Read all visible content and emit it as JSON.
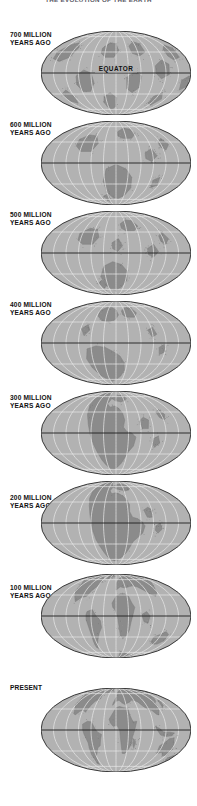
{
  "figure": {
    "title": "THE EVOLUTION OF THE EARTH",
    "equator_label": "EQUATOR",
    "colors": {
      "background": "#ffffff",
      "ocean": "#b2b2b2",
      "land": "#8b8b8b",
      "land_shade": "#7d7d7d",
      "graticule": "#e8e8e8",
      "outline": "#3a3a3a",
      "equator_line": "#1e1e1e",
      "label_text": "#111111",
      "title_text": "#5a5a66"
    },
    "projection": "mollweide-ellipse",
    "panel_count": 8
  },
  "panels": [
    {
      "id": "panel-700ma",
      "label_line1": "700 MILLION",
      "label_line2": "YEARS AGO",
      "age_ma": 700,
      "has_equator_label": true,
      "continents": "rodinia-fragments"
    },
    {
      "id": "panel-600ma",
      "label_line1": "600 MILLION",
      "label_line2": "YEARS AGO",
      "age_ma": 600,
      "has_equator_label": false,
      "continents": "pannotia-dispersed"
    },
    {
      "id": "panel-500ma",
      "label_line1": "500 MILLION",
      "label_line2": "YEARS AGO",
      "age_ma": 500,
      "has_equator_label": false,
      "continents": "cambrian-scattered"
    },
    {
      "id": "panel-400ma",
      "label_line1": "400 MILLION",
      "label_line2": "YEARS AGO",
      "age_ma": 400,
      "has_equator_label": false,
      "continents": "devonian-laurussia-gondwana"
    },
    {
      "id": "panel-300ma",
      "label_line1": "300 MILLION",
      "label_line2": "YEARS AGO",
      "age_ma": 300,
      "has_equator_label": false,
      "continents": "pangaea-forming"
    },
    {
      "id": "panel-200ma",
      "label_line1": "200 MILLION",
      "label_line2": "YEARS AGO",
      "age_ma": 200,
      "has_equator_label": false,
      "continents": "pangaea"
    },
    {
      "id": "panel-100ma",
      "label_line1": "100 MILLION",
      "label_line2": "YEARS AGO",
      "age_ma": 100,
      "has_equator_label": false,
      "continents": "cretaceous-rifting"
    },
    {
      "id": "panel-present",
      "label_line1": "PRESENT",
      "label_line2": "",
      "age_ma": 0,
      "has_equator_label": false,
      "continents": "modern"
    }
  ]
}
